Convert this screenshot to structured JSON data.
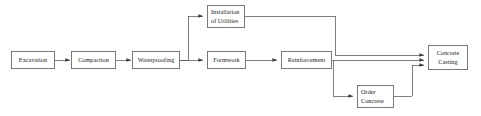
{
  "diagram": {
    "background_color": "#ffffff",
    "border_color": "#7a7a7a",
    "line_color": "#555555",
    "text_color": "#1a1a1a",
    "nodes": [
      {
        "id": "excavation",
        "label": "Excavation",
        "lines": [
          "Excavation"
        ]
      },
      {
        "id": "compaction",
        "label": "Compaction",
        "lines": [
          "Compaction"
        ]
      },
      {
        "id": "waterproofing",
        "label": "Waterproofing",
        "lines": [
          "Waterproofing"
        ]
      },
      {
        "id": "utilities",
        "label": "Installation of Utilities",
        "lines": [
          "Installation",
          "of Utilities"
        ]
      },
      {
        "id": "formwork",
        "label": "Formwork",
        "lines": [
          "Formwork"
        ]
      },
      {
        "id": "reinforcement",
        "label": "Reinforcement",
        "lines": [
          "Reinforcement"
        ]
      },
      {
        "id": "order-concrete",
        "label": "Order Concrete",
        "lines": [
          "Order",
          "Concrete"
        ]
      },
      {
        "id": "concrete-casting",
        "label": "Concrete Casting",
        "lines": [
          "Concrete",
          "Casting"
        ]
      }
    ],
    "edges": [
      {
        "from": "excavation",
        "to": "compaction"
      },
      {
        "from": "compaction",
        "to": "waterproofing"
      },
      {
        "from": "waterproofing",
        "to": "utilities"
      },
      {
        "from": "waterproofing",
        "to": "formwork"
      },
      {
        "from": "formwork",
        "to": "reinforcement"
      },
      {
        "from": "utilities",
        "to": "concrete-casting"
      },
      {
        "from": "reinforcement",
        "to": "concrete-casting"
      },
      {
        "from": "reinforcement",
        "to": "order-concrete"
      },
      {
        "from": "order-concrete",
        "to": "concrete-casting"
      }
    ]
  }
}
